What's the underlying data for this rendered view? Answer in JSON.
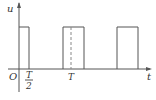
{
  "diagram": {
    "y_axis_label": "u",
    "x_axis_label": "t",
    "origin_label": "O",
    "tick_half_num": "T",
    "tick_half_den": "2",
    "tick_T": "T"
  }
}
